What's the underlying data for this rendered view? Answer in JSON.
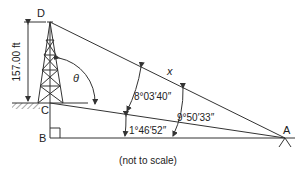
{
  "diagram": {
    "type": "survey-triangulation",
    "points": {
      "D": "D",
      "C": "C",
      "B": "B",
      "A": "A"
    },
    "height_label": "157.00 ft",
    "unknown_label": "x",
    "theta_label": "θ",
    "angles": {
      "angle_DAC": "8°03′40″",
      "angle_CAB": "1°46′52″",
      "angle_DAB": "9°50′33″"
    },
    "note": "(not to scale)",
    "colors": {
      "line": "#333333",
      "text": "#222222",
      "background": "#ffffff"
    }
  }
}
